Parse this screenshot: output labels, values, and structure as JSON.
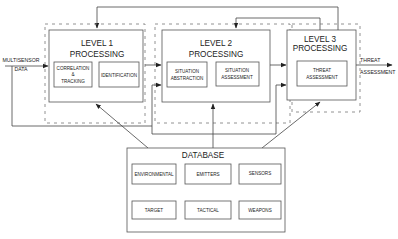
{
  "diagram": {
    "input": {
      "line1": "MULTISENSOR",
      "line2": "DATA"
    },
    "output": {
      "line1": "THREAT",
      "line2": "ASSESSMENT"
    },
    "level1": {
      "title_line1": "LEVEL 1",
      "title_line2": "PROCESSING",
      "modules": [
        {
          "lines": [
            "CORRELATION",
            "&",
            "TRACKING"
          ]
        },
        {
          "lines": [
            "IDENTIFICATION"
          ]
        }
      ]
    },
    "level2": {
      "title_line1": "LEVEL 2",
      "title_line2": "PROCESSING",
      "modules": [
        {
          "lines": [
            "SITUATION",
            "ABSTRACTION"
          ]
        },
        {
          "lines": [
            "SITUATION",
            "ASSESSMENT"
          ]
        }
      ]
    },
    "level3": {
      "title_line1": "LEVEL 3",
      "title_line2": "PROCESSING",
      "modules": [
        {
          "lines": [
            "THREAT",
            "ASSESSMENT"
          ]
        }
      ]
    },
    "database": {
      "title": "DATABASE",
      "items": [
        "ENVIRONMENTAL",
        "EMITTERS",
        "SENSORS",
        "TARGET",
        "TACTICAL",
        "WEAPONS"
      ]
    }
  }
}
